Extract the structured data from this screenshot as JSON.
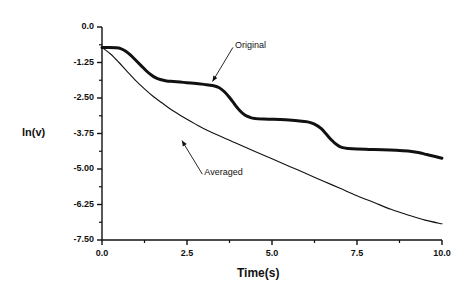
{
  "chart_data": {
    "type": "line",
    "title": "",
    "xlabel": "Time(s)",
    "ylabel": "ln(v)",
    "xlim": [
      0.0,
      10.0
    ],
    "ylim": [
      -7.5,
      0.0
    ],
    "grid": false,
    "legend_position": "inline-annotations",
    "xticks": [
      "0.0",
      "2.5",
      "5.0",
      "7.5",
      "10.0"
    ],
    "xtick_values": [
      0.0,
      2.5,
      5.0,
      7.5,
      10.0
    ],
    "xminor_values": [
      1.25,
      3.75,
      6.25,
      8.75
    ],
    "yticks": [
      "0.0",
      "-1.25",
      "-2.50",
      "-3.75",
      "-5.00",
      "-6.25",
      "-7.50"
    ],
    "ytick_values": [
      0.0,
      -1.25,
      -2.5,
      -3.75,
      -5.0,
      -6.25,
      -7.5
    ],
    "yminor_values": [
      -0.625,
      -1.875,
      -3.125,
      -4.375,
      -5.625,
      -6.875
    ],
    "series": [
      {
        "name": "Original",
        "style": "thick-solid",
        "color": "#111111",
        "annotation": {
          "label": "Original",
          "label_x": 3.85,
          "label_y": -0.72,
          "arrow_to_x": 3.25,
          "arrow_to_y": -1.92
        },
        "points": [
          [
            0.0,
            -0.72
          ],
          [
            0.2,
            -0.72
          ],
          [
            0.4,
            -0.73
          ],
          [
            0.55,
            -0.76
          ],
          [
            0.7,
            -0.85
          ],
          [
            0.85,
            -1.0
          ],
          [
            1.0,
            -1.18
          ],
          [
            1.15,
            -1.36
          ],
          [
            1.3,
            -1.54
          ],
          [
            1.45,
            -1.69
          ],
          [
            1.6,
            -1.8
          ],
          [
            1.75,
            -1.86
          ],
          [
            1.9,
            -1.9
          ],
          [
            2.1,
            -1.92
          ],
          [
            2.4,
            -1.95
          ],
          [
            2.7,
            -1.98
          ],
          [
            3.0,
            -2.02
          ],
          [
            3.25,
            -2.06
          ],
          [
            3.45,
            -2.14
          ],
          [
            3.6,
            -2.28
          ],
          [
            3.75,
            -2.48
          ],
          [
            3.9,
            -2.72
          ],
          [
            4.05,
            -2.94
          ],
          [
            4.2,
            -3.1
          ],
          [
            4.35,
            -3.18
          ],
          [
            4.5,
            -3.22
          ],
          [
            4.75,
            -3.24
          ],
          [
            5.05,
            -3.25
          ],
          [
            5.4,
            -3.27
          ],
          [
            5.75,
            -3.3
          ],
          [
            6.05,
            -3.34
          ],
          [
            6.25,
            -3.42
          ],
          [
            6.45,
            -3.58
          ],
          [
            6.6,
            -3.78
          ],
          [
            6.75,
            -3.98
          ],
          [
            6.9,
            -4.14
          ],
          [
            7.05,
            -4.24
          ],
          [
            7.25,
            -4.28
          ],
          [
            7.5,
            -4.3
          ],
          [
            7.85,
            -4.31
          ],
          [
            8.25,
            -4.32
          ],
          [
            8.65,
            -4.34
          ],
          [
            9.0,
            -4.37
          ],
          [
            9.3,
            -4.42
          ],
          [
            9.55,
            -4.49
          ],
          [
            9.8,
            -4.56
          ],
          [
            10.0,
            -4.62
          ]
        ]
      },
      {
        "name": "Averaged",
        "style": "thin-solid",
        "color": "#111111",
        "annotation": {
          "label": "Averaged",
          "label_x": 2.95,
          "label_y": -5.18,
          "arrow_to_x": 2.35,
          "arrow_to_y": -4.0
        },
        "points": [
          [
            0.0,
            -0.72
          ],
          [
            0.25,
            -0.95
          ],
          [
            0.5,
            -1.25
          ],
          [
            0.75,
            -1.58
          ],
          [
            1.0,
            -1.9
          ],
          [
            1.25,
            -2.18
          ],
          [
            1.5,
            -2.44
          ],
          [
            1.75,
            -2.66
          ],
          [
            2.0,
            -2.88
          ],
          [
            2.25,
            -3.07
          ],
          [
            2.5,
            -3.25
          ],
          [
            2.75,
            -3.42
          ],
          [
            3.0,
            -3.58
          ],
          [
            3.5,
            -3.86
          ],
          [
            4.0,
            -4.12
          ],
          [
            4.5,
            -4.38
          ],
          [
            5.0,
            -4.64
          ],
          [
            5.5,
            -4.9
          ],
          [
            6.0,
            -5.16
          ],
          [
            6.5,
            -5.42
          ],
          [
            7.0,
            -5.68
          ],
          [
            7.5,
            -5.94
          ],
          [
            8.0,
            -6.18
          ],
          [
            8.5,
            -6.42
          ],
          [
            9.0,
            -6.62
          ],
          [
            9.5,
            -6.8
          ],
          [
            10.0,
            -6.93
          ]
        ]
      }
    ]
  },
  "layout": {
    "plot_left": 102,
    "plot_right": 442,
    "plot_top": 27,
    "plot_bottom": 240
  }
}
